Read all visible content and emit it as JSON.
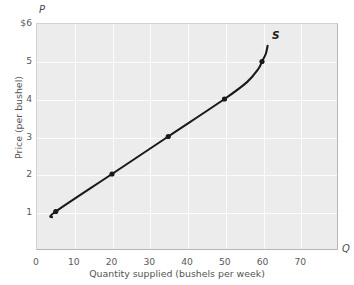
{
  "chart_data": {
    "type": "line",
    "title": "",
    "subtitle": "",
    "xlabel": "Quantity supplied (bushels per week)",
    "ylabel": "Price (per bushel)",
    "x_axis_symbol": "Q",
    "y_axis_symbol": "P",
    "xlim": [
      0,
      80
    ],
    "ylim": [
      0,
      6
    ],
    "grid": true,
    "legend_position": "inline-curve-end",
    "xticks": [
      {
        "value": 0,
        "label": "0"
      },
      {
        "value": 10,
        "label": "10"
      },
      {
        "value": 20,
        "label": "20"
      },
      {
        "value": 30,
        "label": "30"
      },
      {
        "value": 40,
        "label": "40"
      },
      {
        "value": 50,
        "label": "50"
      },
      {
        "value": 60,
        "label": "60"
      },
      {
        "value": 70,
        "label": "70"
      }
    ],
    "yticks": [
      {
        "value": 6,
        "label": "$6"
      },
      {
        "value": 5,
        "label": "5"
      },
      {
        "value": 4,
        "label": "4"
      },
      {
        "value": 3,
        "label": "3"
      },
      {
        "value": 2,
        "label": "2"
      },
      {
        "value": 1,
        "label": "1"
      }
    ],
    "series": [
      {
        "name": "S",
        "annotation": "S",
        "color": "#1a1a1a",
        "marker": "dot",
        "curve_path": [
          {
            "x": 4.0,
            "y": 0.85
          },
          {
            "x": 5.0,
            "y": 1.0
          },
          {
            "x": 20.0,
            "y": 2.0
          },
          {
            "x": 35.0,
            "y": 3.0
          },
          {
            "x": 50.0,
            "y": 4.0
          },
          {
            "x": 56.0,
            "y": 4.45
          },
          {
            "x": 59.0,
            "y": 4.8
          },
          {
            "x": 60.0,
            "y": 5.0
          },
          {
            "x": 61.0,
            "y": 5.2
          },
          {
            "x": 61.5,
            "y": 5.42
          }
        ],
        "data_points": [
          {
            "x": 5,
            "y": 1
          },
          {
            "x": 20,
            "y": 2
          },
          {
            "x": 35,
            "y": 3
          },
          {
            "x": 50,
            "y": 4
          },
          {
            "x": 60,
            "y": 5
          }
        ]
      }
    ],
    "colors": {
      "plot_background": "#ececec",
      "gridline": "#fbfbfb",
      "curve": "#1a1a1a",
      "tick_text": "#5a5a5a",
      "axis_border": "#b6b6b6"
    }
  }
}
